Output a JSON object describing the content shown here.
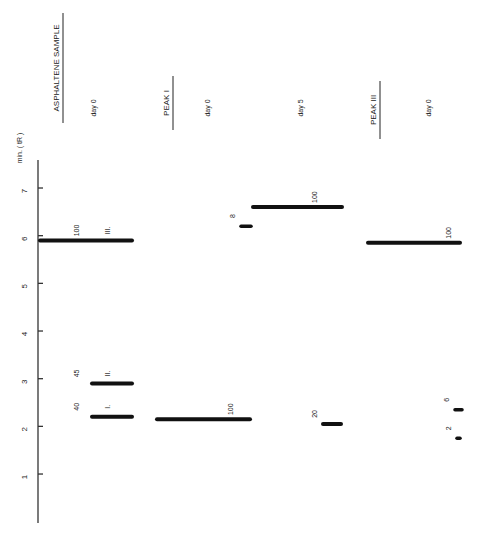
{
  "chart_data": {
    "type": "bar",
    "orientation": "rotated-90",
    "title": "",
    "ylabel": "min. ( tR )",
    "axis": {
      "ticks": [
        1,
        2,
        3,
        4,
        5,
        6,
        7
      ],
      "tick_labels": [
        "1",
        "2",
        "3",
        "4",
        "5",
        "6",
        "7"
      ],
      "range": [
        0,
        7.6
      ]
    },
    "groups": [
      {
        "header": "ASPHALTENE SAMPLE",
        "underlined": true,
        "columns": [
          {
            "label": "day  0",
            "peaks": [
              {
                "tR": 5.9,
                "intensity": 100,
                "value_label": "100",
                "peak_label": "III."
              },
              {
                "tR": 2.9,
                "intensity": 45,
                "value_label": "45",
                "peak_label": "II."
              },
              {
                "tR": 2.2,
                "intensity": 40,
                "value_label": "40",
                "peak_label": "I."
              }
            ]
          }
        ]
      },
      {
        "header": "PEAK  I",
        "underlined": true,
        "columns": [
          {
            "label": "day  0",
            "peaks": [
              {
                "tR": 2.15,
                "intensity": 100,
                "value_label": "100"
              },
              {
                "tR": 6.2,
                "intensity": 8,
                "value_label": "8"
              }
            ]
          },
          {
            "label": "day  5",
            "peaks": [
              {
                "tR": 6.6,
                "intensity": 100,
                "value_label": "100"
              },
              {
                "tR": 2.05,
                "intensity": 20,
                "value_label": "20"
              }
            ]
          }
        ]
      },
      {
        "header": "PEAK  III",
        "underlined": true,
        "columns": [
          {
            "label": "day  0",
            "peaks": [
              {
                "tR": 5.85,
                "intensity": 100,
                "value_label": "100"
              },
              {
                "tR": 2.35,
                "intensity": 6,
                "value_label": "6"
              },
              {
                "tR": 1.75,
                "intensity": 2,
                "value_label": "2"
              }
            ]
          }
        ]
      }
    ]
  }
}
